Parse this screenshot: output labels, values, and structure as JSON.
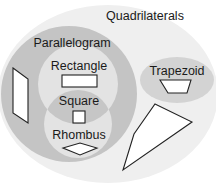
{
  "diagram": {
    "type": "venn",
    "title": "Quadrilaterals",
    "sets": {
      "quadrilaterals": {
        "label": "Quadrilaterals",
        "color": "#efefef"
      },
      "parallelogram": {
        "label": "Parallelogram",
        "color": "#c4c4c4"
      },
      "rectangle": {
        "label": "Rectangle",
        "color": "#e3e3e3"
      },
      "rhombus": {
        "label": "Rhombus",
        "color": "#e3e3e3"
      },
      "square": {
        "label": "Square",
        "color": "#c6c6c6"
      },
      "trapezoid": {
        "label": "Trapezoid",
        "color": "#d3d3d3"
      }
    },
    "relationships": [
      "Parallelogram is a subset of Quadrilaterals",
      "Rectangle is a subset of Parallelogram",
      "Rhombus is a subset of Parallelogram",
      "Square is the intersection of Rectangle and Rhombus",
      "Trapezoid is a subset of Quadrilaterals, disjoint from Parallelogram",
      "A general quadrilateral (kite-like shape) lies in Quadrilaterals only"
    ],
    "example_shapes": [
      "parallelogram",
      "rectangle",
      "square",
      "rhombus",
      "trapezoid",
      "general-quadrilateral"
    ],
    "shape_style": {
      "fill": "#ffffff",
      "stroke": "#222222"
    }
  }
}
